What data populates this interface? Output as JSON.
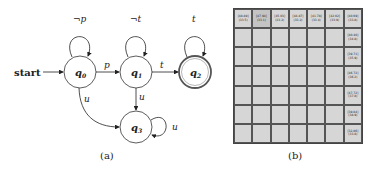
{
  "automaton": {
    "start_label": "start",
    "states": [
      {
        "id": "q0",
        "label": "q",
        "sub": "0",
        "accepting": false
      },
      {
        "id": "q1",
        "label": "q",
        "sub": "1",
        "accepting": false
      },
      {
        "id": "q2",
        "label": "q",
        "sub": "2",
        "accepting": true
      },
      {
        "id": "q3",
        "label": "q",
        "sub": "3",
        "accepting": false
      }
    ],
    "transitions": [
      {
        "from": "q0",
        "to": "q0",
        "label": "¬p"
      },
      {
        "from": "q0",
        "to": "q1",
        "label": "p"
      },
      {
        "from": "q1",
        "to": "q1",
        "label": "¬t"
      },
      {
        "from": "q1",
        "to": "q2",
        "label": "t"
      },
      {
        "from": "q2",
        "to": "q2",
        "label": "t"
      },
      {
        "from": "q0",
        "to": "q3",
        "label": "u"
      },
      {
        "from": "q1",
        "to": "q3",
        "label": "u"
      },
      {
        "from": "q3",
        "to": "q3",
        "label": "u"
      }
    ]
  },
  "grid": {
    "rows": 7,
    "cols": 7,
    "top_row": [
      {
        "a": "[48.89]",
        "b": "(33.5)"
      },
      {
        "a": "[47.94]",
        "b": "(33.1)"
      },
      {
        "a": "[45.03]",
        "b": "(33.2)"
      },
      {
        "a": "[44.87]",
        "b": "(33.2)"
      },
      {
        "a": "[41.78]",
        "b": "(33.4)"
      },
      {
        "a": "[42.02]",
        "b": "(33.9)"
      },
      {
        "a": "[40.69]",
        "b": "(33.8)"
      }
    ],
    "right_col": [
      {
        "a": "[40.40]",
        "b": "(34.8)"
      },
      {
        "a": "[39.71]",
        "b": "(35.9)"
      },
      {
        "a": "[46.72]",
        "b": "(36.2)"
      },
      {
        "a": "[47.72]",
        "b": "(37.8)"
      },
      {
        "a": "[39.84]",
        "b": "(38.9)"
      },
      {
        "a": "[32.86]",
        "b": "(33.8)"
      }
    ]
  },
  "captions": {
    "a": "(a)",
    "b": "(b)"
  }
}
